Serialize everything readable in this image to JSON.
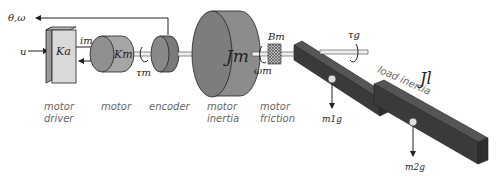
{
  "symbols": {
    "feedback": "θ,ω",
    "input": "u",
    "driver_gain": "Ka",
    "current": "im",
    "motor_constant": "Km",
    "motor_torque": "τm",
    "motor_inertia": "Jm",
    "motor_friction": "Bm",
    "motor_speed": "ωm",
    "gravity_torque": "τg",
    "load_inertia": "Jl",
    "weight_1": "m1g",
    "weight_2": "m2g"
  },
  "captions": {
    "motor_driver": [
      "motor",
      "driver"
    ],
    "motor": [
      "motor"
    ],
    "encoder": [
      "encoder"
    ],
    "motor_inertia": [
      "motor",
      "inertia"
    ],
    "motor_friction": [
      "motor",
      "friction"
    ],
    "load_inertia": "load inertia"
  },
  "colors": {
    "driver_face": "#d9d9d9",
    "motor_body": "#a6a6a6",
    "encoder_body": "#7a7a7a",
    "inertia_body": "#8c8c8c",
    "link_body": "#3a3a3a",
    "caption": "#666666"
  }
}
